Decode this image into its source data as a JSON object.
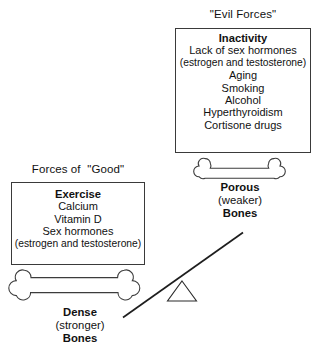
{
  "diagram": {
    "background_color": "#ffffff",
    "ink_color": "#1a1a1a"
  },
  "evil": {
    "heading": "\"Evil Forces\"",
    "items": [
      "Inactivity",
      "Lack of sex hormones",
      "(estrogen and testosterone)",
      "Aging",
      "Smoking",
      "Alcohol",
      "Hyperthyroidism",
      "Cortisone drugs"
    ]
  },
  "good": {
    "heading": "Forces of  \"Good\"",
    "items": [
      "Exercise",
      "Calcium",
      "Vitamin D",
      "Sex hormones",
      "(estrogen and testosterone)"
    ]
  },
  "porous_bone": {
    "icon": "bone-icon",
    "label_line1": "Porous",
    "label_line2": "(weaker)",
    "label_line3": "Bones"
  },
  "dense_bone": {
    "icon": "bone-icon",
    "label_line1": "Dense",
    "label_line2": "(stronger)",
    "label_line3": "Bones"
  },
  "balance": {
    "fulcrum_icon": "triangle-fulcrum-icon",
    "beam_icon": "tilted-beam-icon"
  }
}
